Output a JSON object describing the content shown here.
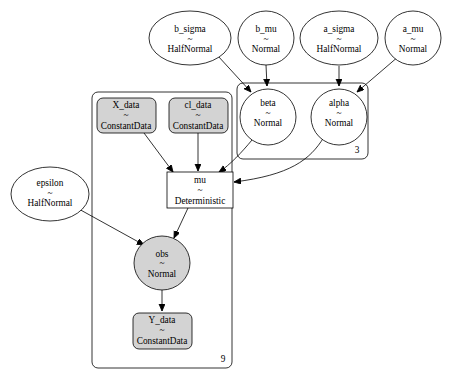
{
  "nodes": {
    "b_sigma": {
      "name": "b_sigma",
      "tilde": "~",
      "dist": "HalfNormal"
    },
    "b_mu": {
      "name": "b_mu",
      "tilde": "~",
      "dist": "Normal"
    },
    "a_sigma": {
      "name": "a_sigma",
      "tilde": "~",
      "dist": "HalfNormal"
    },
    "a_mu": {
      "name": "a_mu",
      "tilde": "~",
      "dist": "Normal"
    },
    "beta": {
      "name": "beta",
      "tilde": "~",
      "dist": "Normal"
    },
    "alpha": {
      "name": "alpha",
      "tilde": "~",
      "dist": "Normal"
    },
    "X_data": {
      "name": "X_data",
      "tilde": "~",
      "dist": "ConstantData"
    },
    "cl_data": {
      "name": "cl_data",
      "tilde": "~",
      "dist": "ConstantData"
    },
    "mu": {
      "name": "mu",
      "tilde": "~",
      "dist": "Deterministic"
    },
    "epsilon": {
      "name": "epsilon",
      "tilde": "~",
      "dist": "HalfNormal"
    },
    "obs": {
      "name": "obs",
      "tilde": "~",
      "dist": "Normal"
    },
    "Y_data": {
      "name": "Y_data",
      "tilde": "~",
      "dist": "ConstantData"
    }
  },
  "plates": {
    "plate3": {
      "label": "3"
    },
    "plate9": {
      "label": "9"
    }
  },
  "colors": {
    "observed_fill": "#d3d3d3",
    "stroke": "#000000",
    "background": "#ffffff"
  }
}
